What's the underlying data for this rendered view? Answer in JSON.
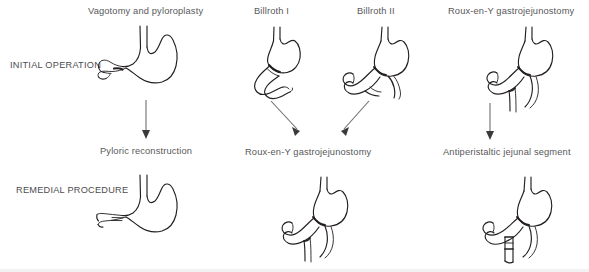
{
  "diagram": {
    "title_present": false,
    "row_labels": [
      {
        "id": "initial-operation",
        "text": "INITIAL OPERATION"
      },
      {
        "id": "remedial-procedure",
        "text": "REMEDIAL PROCEDURE"
      }
    ],
    "top_row_labels": [
      {
        "id": "vagotomy-and-pyloroplasty",
        "text": "Vagotomy and pyloroplasty"
      },
      {
        "id": "billroth-i",
        "text": "Billroth I"
      },
      {
        "id": "billroth-ii",
        "text": "Billroth II"
      },
      {
        "id": "roux-en-y-gastrojejunostomy-top",
        "text": "Roux-en-Y gastrojejunostomy"
      }
    ],
    "bottom_row_labels": [
      {
        "id": "pyloric-reconstruction",
        "text": "Pyloric reconstruction"
      },
      {
        "id": "roux-en-y-gastrojejunostomy-bottom",
        "text": "Roux-en-Y gastrojejunostomy"
      },
      {
        "id": "antiperistaltic-jejunal-segment",
        "text": "Antiperistaltic jejunal segment"
      }
    ],
    "figures": [
      {
        "id": "stomach-vagotomy-pyloroplasty",
        "row": "initial",
        "caption": "Vagotomy and pyloroplasty"
      },
      {
        "id": "stomach-billroth-i",
        "row": "initial",
        "caption": "Billroth I"
      },
      {
        "id": "stomach-billroth-ii",
        "row": "initial",
        "caption": "Billroth II"
      },
      {
        "id": "stomach-roux-en-y-initial",
        "row": "initial",
        "caption": "Roux-en-Y gastrojejunostomy"
      },
      {
        "id": "stomach-pyloric-reconstruction",
        "row": "remedial",
        "caption": "Pyloric reconstruction"
      },
      {
        "id": "stomach-roux-en-y-remedial",
        "row": "remedial",
        "caption": "Roux-en-Y gastrojejunostomy"
      },
      {
        "id": "stomach-antiperistaltic-jejunal-segment",
        "row": "remedial",
        "caption": "Antiperistaltic jejunal segment"
      }
    ],
    "arrows": [
      {
        "id": "arrow-vagotomy-to-pyloric-reconstruction",
        "direction": "down"
      },
      {
        "id": "arrow-billroth-i-to-roux-en-y",
        "direction": "down-right"
      },
      {
        "id": "arrow-billroth-ii-to-roux-en-y",
        "direction": "down-left"
      },
      {
        "id": "arrow-roux-en-y-to-antiperistaltic",
        "direction": "down"
      }
    ],
    "colors": {
      "background": "#ffffff",
      "line": "#231f20",
      "label_text": "#58585a",
      "row_label_text": "#4d4d4f",
      "arrow": "#6e6e70",
      "bottom_bar": "#f2f2f2"
    }
  }
}
